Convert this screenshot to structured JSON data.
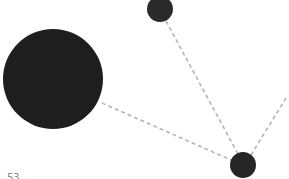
{
  "diagram": {
    "type": "network-graph",
    "background": "#ffffff",
    "edge_style": {
      "color": "#b4b4b4",
      "dashed": true
    },
    "nodes": [
      {
        "id": "node-large",
        "cx": 53,
        "cy": 79,
        "r": 50,
        "color": "#1e1e1e"
      },
      {
        "id": "node-top",
        "cx": 160,
        "cy": 9,
        "r": 13,
        "color": "#2a2a2a"
      },
      {
        "id": "node-bottom-right",
        "cx": 243,
        "cy": 165,
        "r": 13,
        "color": "#262626"
      }
    ],
    "edges": [
      {
        "from": "node-top",
        "to": "node-bottom-right"
      },
      {
        "from": "node-large",
        "to": "node-bottom-right"
      },
      {
        "from": "node-bottom-right",
        "to": "offscreen-top-right"
      }
    ],
    "labels": {
      "bottom_left": "53"
    }
  }
}
